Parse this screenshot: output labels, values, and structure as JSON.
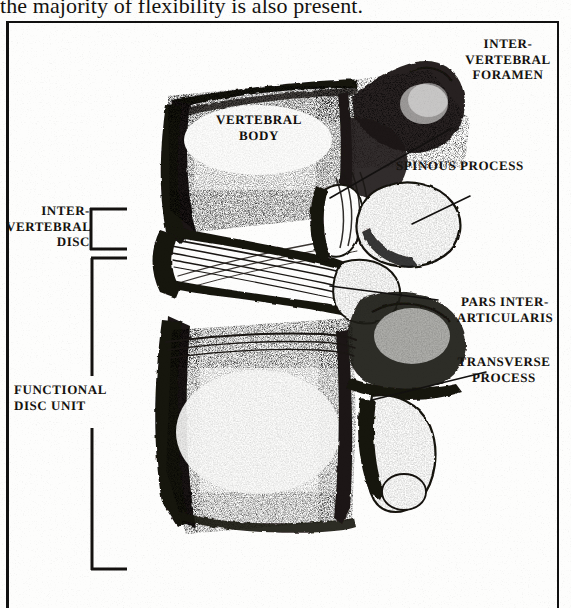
{
  "page": {
    "body_text": "the majority of flexibility is also present.",
    "background_color": "#fdfdfc",
    "ink_color": "#15130f"
  },
  "figure": {
    "frame": {
      "border_color": "#111111"
    },
    "illustration": {
      "subject": "lumbar-vertebra-lateral-view",
      "style": "pen-and-ink stipple engraving",
      "description": "Lateral cut-away view of two vertebral bodies with intervertebral disc fibres, posterior elements and facet joints"
    },
    "labels": [
      {
        "id": "intervertebral-foramen",
        "text": "INTER-\nVERTEBRAL\nFORAMEN",
        "align": "center",
        "leader": true
      },
      {
        "id": "spinous-process",
        "text": "SPINOUS PROCESS",
        "align": "left",
        "leader": true
      },
      {
        "id": "pars-interarticularis",
        "text": "PARS INTER-\nARTICULARIS",
        "align": "center",
        "leader": true
      },
      {
        "id": "transverse-process",
        "text": "TRANSVERSE\nPROCESS",
        "align": "center",
        "leader": true
      },
      {
        "id": "intervertebral-disc",
        "text": "INTER-\nVERTEBRAL\nDISC",
        "align": "right",
        "leader": false,
        "bracket": "small"
      },
      {
        "id": "functional-disc-unit",
        "text": "FUNCTIONAL\nDISC UNIT",
        "align": "left",
        "leader": false,
        "bracket": "large"
      },
      {
        "id": "vertebral-body",
        "text": "VERTEBRAL\nBODY",
        "align": "center",
        "leader": false,
        "on_illustration": true
      }
    ]
  }
}
